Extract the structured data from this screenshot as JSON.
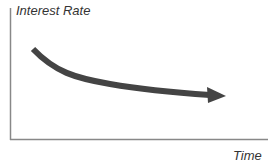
{
  "diagram": {
    "y_axis_label": "Interest Rate",
    "x_axis_label": "Time",
    "curve_color": "#444444",
    "axis_color": "#888888",
    "trend": "decreasing, flattening over time"
  }
}
